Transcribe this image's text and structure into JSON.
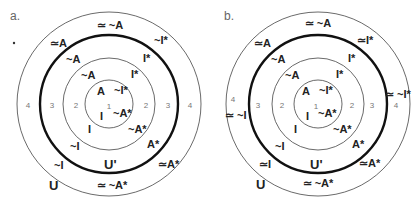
{
  "panels": [
    {
      "id": "a",
      "label": "a.",
      "center": [
        109,
        104
      ],
      "rings": {
        "r1": 24,
        "r2": 46,
        "r3": 69,
        "r4": 92
      },
      "ring_numbers": {
        "one": "1",
        "two": "2",
        "three": "3",
        "four": "4"
      },
      "labels": {
        "top_outer": "≃ ~A",
        "upper_left_outer": "≃A",
        "upper_right_outer": "~I*",
        "upper_left_ring3": "~A",
        "upper_right_ring3": "I*",
        "upper_left_ring2": "~A",
        "upper_right_ring2": "I*",
        "inner_A": "A",
        "inner_notIstar": "~I*",
        "inner_I": "I",
        "inner_notAstar": "~A*",
        "lower_left_ring2": "I",
        "lower_right_ring2": "~A*",
        "lower_left_ring3": "~I",
        "lower_right_ring3": "A*",
        "u_prime": "U'",
        "lower_left_outer": "~I",
        "lower_right_outer": "≃A*",
        "bottom_outer": "≃ ~A*",
        "universe": "U"
      }
    },
    {
      "id": "b",
      "label": "b.",
      "center": [
        318,
        104
      ],
      "rings": {
        "r1": 24,
        "r2": 46,
        "r3": 69,
        "r4": 92
      },
      "ring_numbers": {
        "one": "1",
        "two": "2",
        "three": "3",
        "four": "4"
      },
      "labels": {
        "top_outer": "≃ ~A",
        "upper_left_outer": "≃A",
        "upper_right_outer": "≃I*",
        "right_outer": "≃ ~I*",
        "left_outer": "≃ ~I",
        "upper_left_ring3": "~A",
        "upper_right_ring3": "I*",
        "upper_left_ring2": "~A",
        "upper_right_ring2": "I*",
        "inner_A": "A",
        "inner_notIstar": "~I*",
        "inner_I": "I",
        "inner_notAstar": "~A*",
        "lower_left_ring2": "I",
        "lower_right_ring2": "~A*",
        "lower_left_ring3": "~I",
        "lower_right_ring3": "A*",
        "u_prime": "U'",
        "lower_left_outer": "≃I",
        "lower_right_outer": "≃A*",
        "bottom_outer": "≃ ~A*",
        "universe": "U"
      }
    }
  ],
  "colors": {
    "line": "#333333",
    "text": "#222222",
    "number": "#777777"
  }
}
